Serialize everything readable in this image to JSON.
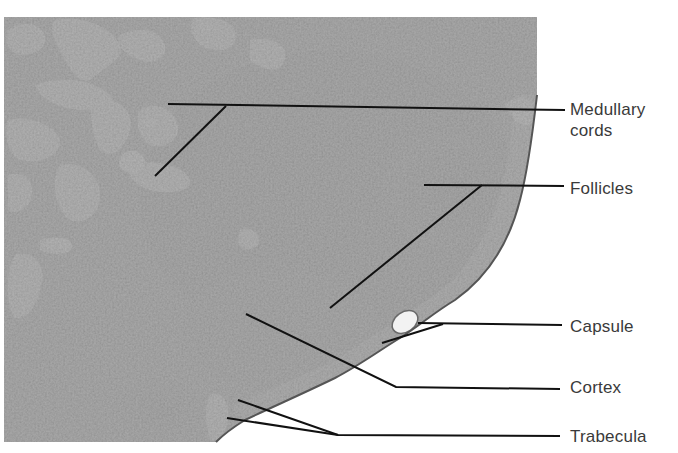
{
  "figure": {
    "labels": [
      {
        "id": "medullary-cords",
        "lines": [
          "Medullary",
          "cords"
        ],
        "top": 99
      },
      {
        "id": "follicles",
        "lines": [
          "Follicles"
        ],
        "top": 178
      },
      {
        "id": "capsule",
        "lines": [
          "Capsule"
        ],
        "top": 316
      },
      {
        "id": "cortex",
        "lines": [
          "Cortex"
        ],
        "top": 377
      },
      {
        "id": "trabecula",
        "lines": [
          "Trabecula"
        ],
        "top": 426
      }
    ],
    "colors": {
      "background": "#ffffff",
      "tissue_dark": "#4a4a4a",
      "tissue_mid": "#6e6e6e",
      "tissue_light": "#d8d8d8",
      "leader_line": "#111111",
      "label_text": "#3a3a3a"
    }
  }
}
